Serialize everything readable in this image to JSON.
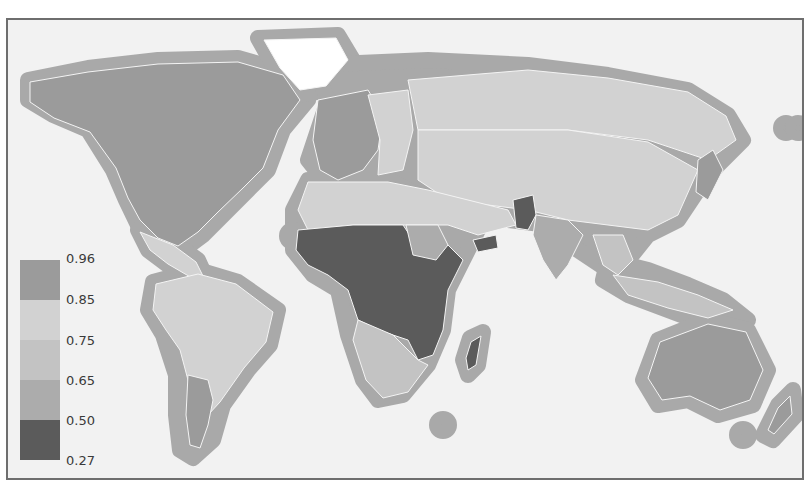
{
  "map": {
    "type": "choropleth",
    "projection": "world",
    "style": "grayscale",
    "colors": {
      "background": "#f2f2f2",
      "ocean_halo": "#a9a9a9",
      "border": "#f4f4f4",
      "no_data": "#ffffff",
      "frame": "#6e6e6e"
    }
  },
  "legend": {
    "tick_labels": [
      "0.96",
      "0.85",
      "0.75",
      "0.65",
      "0.50",
      "0.27"
    ],
    "bins": [
      {
        "range": "0.85–0.96",
        "color": "#9b9b9b"
      },
      {
        "range": "0.75–0.85",
        "color": "#d2d2d2"
      },
      {
        "range": "0.65–0.75",
        "color": "#c3c3c3"
      },
      {
        "range": "0.50–0.65",
        "color": "#acacac"
      },
      {
        "range": "0.27–0.50",
        "color": "#5b5b5b"
      }
    ]
  },
  "regions": [
    {
      "name": "North America (USA/Canada)",
      "bin": 0
    },
    {
      "name": "Greenland",
      "bin": -1
    },
    {
      "name": "Mexico & Central America",
      "bin": 1
    },
    {
      "name": "South America",
      "bin": 1
    },
    {
      "name": "Argentina",
      "bin": 0
    },
    {
      "name": "Western Europe",
      "bin": 0
    },
    {
      "name": "Eastern Europe",
      "bin": 1
    },
    {
      "name": "Russia",
      "bin": 1
    },
    {
      "name": "China & Central Asia",
      "bin": 1
    },
    {
      "name": "North Africa & Middle East",
      "bin": 1
    },
    {
      "name": "Sub-Saharan Africa",
      "bin": 4
    },
    {
      "name": "Sudan",
      "bin": 3
    },
    {
      "name": "Southern Africa",
      "bin": 2
    },
    {
      "name": "Pakistan",
      "bin": 4
    },
    {
      "name": "Yemen",
      "bin": 4
    },
    {
      "name": "India",
      "bin": 3
    },
    {
      "name": "Southeast Asia",
      "bin": 2
    },
    {
      "name": "Japan & Korea",
      "bin": 0
    },
    {
      "name": "Australia",
      "bin": 0
    },
    {
      "name": "New Zealand",
      "bin": 0
    },
    {
      "name": "Madagascar",
      "bin": 4
    }
  ]
}
